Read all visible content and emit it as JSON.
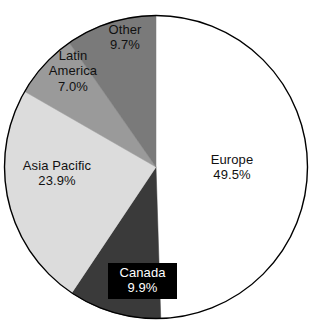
{
  "chart_data": {
    "type": "pie",
    "title": "",
    "subtitle": "",
    "xlabel": "",
    "ylabel": "",
    "legend_position": "none",
    "grid": false,
    "value_unit": "%",
    "start_angle_deg": 0,
    "direction": "clockwise",
    "categories": [
      "Europe",
      "Canada",
      "Asia Pacific",
      "Latin America",
      "Other"
    ],
    "values": [
      49.5,
      9.9,
      23.9,
      7.0,
      9.7
    ],
    "slices": [
      {
        "label": "Europe",
        "value": 49.5,
        "value_text": "49.5%",
        "color": "#ffffff",
        "label_color": "#111111",
        "label_boxed": false,
        "start_deg": 0,
        "end_deg": 178.2
      },
      {
        "label": "Canada",
        "value": 9.9,
        "value_text": "9.9%",
        "color": "#3a3a3a",
        "label_color": "#ffffff",
        "label_boxed": true,
        "start_deg": 178.2,
        "end_deg": 213.8
      },
      {
        "label": "Asia Pacific",
        "value": 23.9,
        "value_text": "23.9%",
        "color": "#dcdcdc",
        "label_color": "#111111",
        "label_boxed": false,
        "start_deg": 213.8,
        "end_deg": 299.9
      },
      {
        "label": "Latin America",
        "value": 7.0,
        "value_text": "7.0%",
        "color": "#9a9a9a",
        "label_color": "#111111",
        "label_boxed": false,
        "start_deg": 299.9,
        "end_deg": 325.1
      },
      {
        "label": "Other",
        "value": 9.7,
        "value_text": "9.7%",
        "color": "#7a7a7a",
        "label_color": "#111111",
        "label_boxed": false,
        "start_deg": 325.1,
        "end_deg": 360
      }
    ],
    "outline_color": "#000000",
    "background": "#ffffff"
  },
  "labels": {
    "europe": {
      "name": "Europe",
      "value": "49.5%"
    },
    "canada": {
      "name": "Canada",
      "value": "9.9%"
    },
    "asia_pacific": {
      "name": "Asia Pacific",
      "value": "23.9%"
    },
    "latin_america_line1": "Latin",
    "latin_america_line2": "America",
    "latin_america": {
      "name": "Latin America",
      "value": "7.0%"
    },
    "other": {
      "name": "Other",
      "value": "9.7%"
    }
  }
}
